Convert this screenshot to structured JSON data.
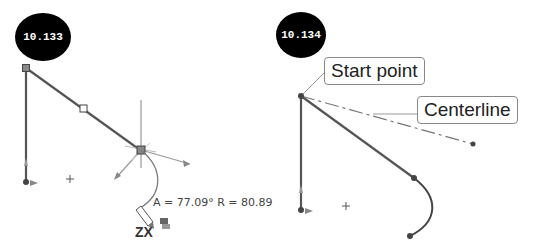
{
  "figures": [
    {
      "id": "10.133",
      "label": "10.133",
      "readout": "A = 77.09° R = 80.89",
      "cursor_label": "ZX",
      "cursor_icon": "pencil-icon"
    },
    {
      "id": "10.134",
      "label": "10.134",
      "callouts": {
        "start_point": "Start point",
        "centerline": "Centerline"
      }
    }
  ],
  "colors": {
    "line": "#555555",
    "inference": "#888888",
    "badge_bg": "#000000",
    "badge_text": "#ffffff"
  }
}
